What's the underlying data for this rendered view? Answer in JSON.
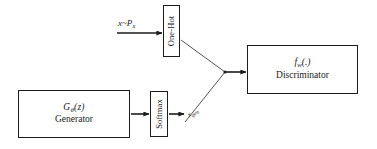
{
  "diagram": {
    "background_color": "#ffffff",
    "stroke_color": "#1c1c1c",
    "text_color": "#1a1a1a",
    "nodes": {
      "generator": {
        "formula_prefix": "G",
        "formula_sub": "θ",
        "formula_suffix": "(z)",
        "caption": "Generator"
      },
      "discriminator": {
        "formula_prefix": "f",
        "formula_sub": "w",
        "formula_suffix": "(.)",
        "caption": "Discriminator"
      },
      "onehot": {
        "label": "One-Hot"
      },
      "softmax": {
        "label": "Softmax"
      }
    },
    "labels": {
      "data_source_prefix": "x~P",
      "data_source_sub": "x",
      "generated_prefix": "x",
      "generated_sub": "gen"
    }
  }
}
